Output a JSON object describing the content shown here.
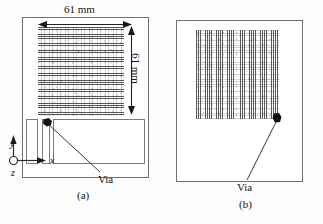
{
  "figure": {
    "background_color": "#ffffff",
    "line_color": "#4a4a4a"
  },
  "panels": [
    {
      "id": "a",
      "caption": "(a)",
      "dimensions": {
        "width_label": "61 mm",
        "height_label": "61 mm"
      },
      "axes": {
        "x_label": "x",
        "y_label": "y",
        "z_label": "z",
        "z_symbol": "out-of-page-circle"
      },
      "callout": {
        "label": "Via",
        "target": "top-left of second narrow strip"
      },
      "patch": {
        "texture": "horizontal-stripes"
      },
      "sub_rectangles": [
        {
          "name": "narrow-strip-left"
        },
        {
          "name": "narrow-strip-right"
        },
        {
          "name": "wide-ground-rect"
        }
      ]
    },
    {
      "id": "b",
      "caption": "(b)",
      "callout": {
        "label": "Via",
        "target": "bottom-right of striped patch"
      },
      "patch": {
        "texture": "vertical-stripes"
      }
    }
  ]
}
